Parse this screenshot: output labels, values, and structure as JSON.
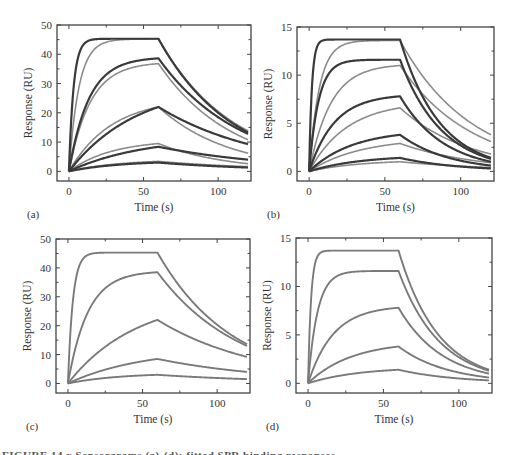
{
  "figure": {
    "caption_fragment": "FIGURE 14.x  Sensorgrams (a)-(d): fitted SPR binding responses"
  },
  "colors": {
    "data_line": "#3a3a3a",
    "fit_line": "#8c8c8c",
    "single_line": "#7a7a7a",
    "axis": "#444444"
  },
  "chart_data": [
    {
      "panel": "(a)",
      "type": "line",
      "title": "",
      "xlabel": "Time (s)",
      "ylabel": "Response (RU)",
      "xlim": [
        -8,
        122
      ],
      "ylim": [
        -3.3,
        50
      ],
      "xticks": [
        0,
        50,
        100
      ],
      "yticks": [
        0,
        10,
        20,
        30,
        40,
        50
      ],
      "grid": false,
      "legend": null,
      "frame": {
        "left": 57,
        "top": 25,
        "right": 251,
        "bottom": 181
      },
      "association_end": 60,
      "t_end": 120,
      "series": [
        {
          "name": "data 1",
          "style": "data",
          "peak": 45.3,
          "kon_obs": 0.32,
          "end": 13.3
        },
        {
          "name": "fit 1",
          "style": "fit",
          "peak": 45.2,
          "kon_obs": 0.15,
          "end": 13.8
        },
        {
          "name": "data 2",
          "style": "data",
          "peak": 38.6,
          "kon_obs": 0.075,
          "end": 12.8
        },
        {
          "name": "fit 2",
          "style": "fit",
          "peak": 36.8,
          "kon_obs": 0.07,
          "end": 10.8
        },
        {
          "name": "data 3",
          "style": "data",
          "peak": 22.0,
          "kon_obs": 0.022,
          "end": 9.3
        },
        {
          "name": "fit 3",
          "style": "fit",
          "peak": 22.0,
          "kon_obs": 0.035,
          "end": 6.2
        },
        {
          "name": "data 4",
          "style": "data",
          "peak": 8.4,
          "kon_obs": 0.02,
          "end": 4.0
        },
        {
          "name": "fit 4",
          "style": "fit",
          "peak": 9.5,
          "kon_obs": 0.035,
          "end": 2.6
        },
        {
          "name": "data 5",
          "style": "data",
          "peak": 3.0,
          "kon_obs": 0.03,
          "end": 1.3
        },
        {
          "name": "fit 5",
          "style": "fit",
          "peak": 3.4,
          "kon_obs": 0.03,
          "end": 1.6
        }
      ]
    },
    {
      "panel": "(b)",
      "type": "line",
      "title": "",
      "xlabel": "Time (s)",
      "ylabel": "Response (RU)",
      "xlim": [
        -8,
        122
      ],
      "ylim": [
        -1,
        15
      ],
      "xticks": [
        0,
        50,
        100
      ],
      "yticks": [
        0,
        5,
        10,
        15
      ],
      "grid": false,
      "legend": null,
      "frame": {
        "left": 297,
        "top": 27,
        "right": 494,
        "bottom": 181
      },
      "association_end": 60,
      "t_end": 120,
      "series": [
        {
          "name": "data 1",
          "style": "data",
          "peak": 13.7,
          "kon_obs": 0.55,
          "end": 1.4
        },
        {
          "name": "fit 1",
          "style": "fit",
          "peak": 13.6,
          "kon_obs": 0.15,
          "end": 3.8
        },
        {
          "name": "data 2",
          "style": "data",
          "peak": 11.6,
          "kon_obs": 0.16,
          "end": 1.3
        },
        {
          "name": "fit 2",
          "style": "fit",
          "peak": 11.0,
          "kon_obs": 0.07,
          "end": 3.1
        },
        {
          "name": "data 3",
          "style": "data",
          "peak": 7.8,
          "kon_obs": 0.06,
          "end": 1.0
        },
        {
          "name": "fit 3",
          "style": "fit",
          "peak": 6.6,
          "kon_obs": 0.04,
          "end": 1.8
        },
        {
          "name": "data 4",
          "style": "data",
          "peak": 3.8,
          "kon_obs": 0.035,
          "end": 0.6
        },
        {
          "name": "fit 4",
          "style": "fit",
          "peak": 2.9,
          "kon_obs": 0.03,
          "end": 0.9
        },
        {
          "name": "data 5",
          "style": "data",
          "peak": 1.4,
          "kon_obs": 0.03,
          "end": 0.3
        },
        {
          "name": "fit 5",
          "style": "fit",
          "peak": 1.0,
          "kon_obs": 0.03,
          "end": 0.4
        }
      ]
    },
    {
      "panel": "(c)",
      "type": "line",
      "title": "",
      "xlabel": "Time (s)",
      "ylabel": "Response (RU)",
      "xlim": [
        -8,
        122
      ],
      "ylim": [
        -3.3,
        50
      ],
      "xticks": [
        0,
        50,
        100
      ],
      "yticks": [
        0,
        10,
        20,
        30,
        40,
        50
      ],
      "grid": false,
      "legend": null,
      "frame": {
        "left": 56,
        "top": 239,
        "right": 250,
        "bottom": 393
      },
      "association_end": 60,
      "t_end": 120,
      "series": [
        {
          "name": "curve 1",
          "style": "single",
          "peak": 45.3,
          "kon_obs": 0.3,
          "end": 13.6
        },
        {
          "name": "curve 2",
          "style": "single",
          "peak": 38.5,
          "kon_obs": 0.075,
          "end": 13.0
        },
        {
          "name": "curve 3",
          "style": "single",
          "peak": 22.0,
          "kon_obs": 0.022,
          "end": 9.2
        },
        {
          "name": "curve 4",
          "style": "single",
          "peak": 8.5,
          "kon_obs": 0.02,
          "end": 4.0
        },
        {
          "name": "curve 5",
          "style": "single",
          "peak": 3.0,
          "kon_obs": 0.03,
          "end": 1.5
        }
      ]
    },
    {
      "panel": "(d)",
      "type": "line",
      "title": "",
      "xlabel": "Time (s)",
      "ylabel": "Response (RU)",
      "xlim": [
        -8,
        122
      ],
      "ylim": [
        -1,
        15
      ],
      "xticks": [
        0,
        50,
        100
      ],
      "yticks": [
        0,
        5,
        10,
        15
      ],
      "grid": false,
      "legend": null,
      "frame": {
        "left": 296,
        "top": 238,
        "right": 492,
        "bottom": 393
      },
      "association_end": 60,
      "t_end": 120,
      "series": [
        {
          "name": "curve 1",
          "style": "single",
          "peak": 13.7,
          "kon_obs": 0.5,
          "end": 1.4
        },
        {
          "name": "curve 2",
          "style": "single",
          "peak": 11.6,
          "kon_obs": 0.16,
          "end": 1.3
        },
        {
          "name": "curve 3",
          "style": "single",
          "peak": 7.8,
          "kon_obs": 0.06,
          "end": 1.0
        },
        {
          "name": "curve 4",
          "style": "single",
          "peak": 3.8,
          "kon_obs": 0.035,
          "end": 0.6
        },
        {
          "name": "curve 5",
          "style": "single",
          "peak": 1.4,
          "kon_obs": 0.03,
          "end": 0.3
        }
      ]
    }
  ]
}
